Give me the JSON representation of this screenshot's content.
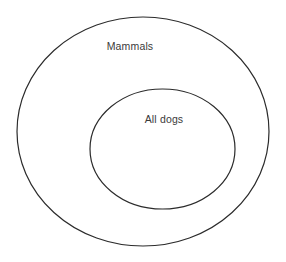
{
  "diagram": {
    "type": "euler-diagram",
    "background_color": "#ffffff",
    "width": 286,
    "height": 262,
    "stroke_color": "#2b2b2b",
    "stroke_width": 1.2,
    "fill_color": "none",
    "label_color": "#3a3a3a",
    "sets": [
      {
        "id": "outer",
        "label": "Mammals",
        "shape": "ellipse",
        "cx": 143,
        "cy": 131.5,
        "rx": 126,
        "ry": 114.5,
        "label_x": 130,
        "label_y": 46
      },
      {
        "id": "inner",
        "label": "All dogs",
        "shape": "ellipse",
        "cx": 162.5,
        "cy": 149,
        "rx": 72.5,
        "ry": 60,
        "label_x": 164,
        "label_y": 119
      }
    ],
    "relationship": "All dogs is a proper subset of Mammals"
  }
}
